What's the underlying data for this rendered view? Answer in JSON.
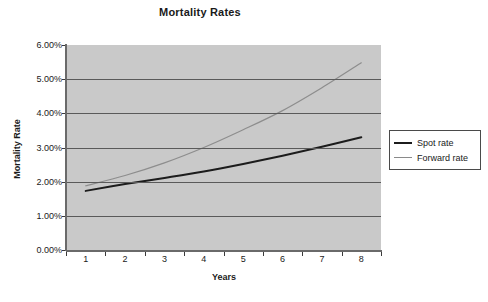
{
  "chart_data": {
    "type": "line",
    "title": "Mortality Rates",
    "xlabel": "Years",
    "ylabel": "Mortality Rate",
    "x": [
      1,
      2,
      3,
      4,
      5,
      6,
      7,
      8
    ],
    "xtick_labels": [
      "1",
      "2",
      "3",
      "4",
      "5",
      "6",
      "7",
      "8"
    ],
    "ytick_labels": [
      "0.00%",
      "1.00%",
      "2.00%",
      "3.00%",
      "4.00%",
      "5.00%",
      "6.00%"
    ],
    "ytick_values": [
      0.0,
      1.0,
      2.0,
      3.0,
      4.0,
      5.0,
      6.0
    ],
    "ylim": [
      0.0,
      6.0
    ],
    "grid": true,
    "legend_position": "right",
    "plot_background": "#c9c9c9",
    "series": [
      {
        "name": "Spot rate",
        "color": "#1c1c1c",
        "values": [
          1.73,
          1.93,
          2.11,
          2.3,
          2.52,
          2.76,
          3.02,
          3.3
        ]
      },
      {
        "name": "Forward rate",
        "color": "#8d8d8d",
        "values": [
          1.88,
          2.18,
          2.55,
          3.0,
          3.52,
          4.08,
          4.75,
          5.48
        ]
      }
    ]
  },
  "legend": {
    "items": [
      {
        "label": "Spot rate"
      },
      {
        "label": "Forward rate"
      }
    ]
  }
}
